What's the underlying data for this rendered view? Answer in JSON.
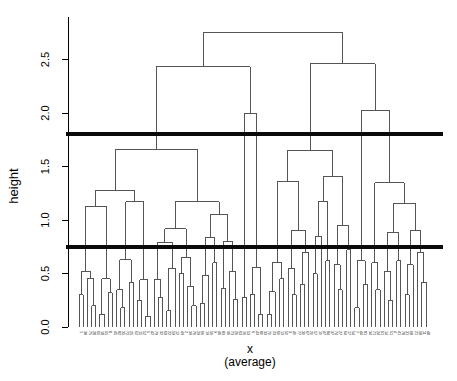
{
  "chart_data": {
    "type": "dendrogram",
    "title": "",
    "ylabel": "height",
    "xlabel": "x",
    "xlabel_sub": "(average)",
    "linkage": "average",
    "y_ticks": [
      0.0,
      0.5,
      1.0,
      1.5,
      2.0,
      2.5
    ],
    "y_tick_labels": [
      "0.0",
      "0.5",
      "1.0",
      "1.5",
      "2.0",
      "2.5"
    ],
    "y_axis_range_drawn": [
      0.0,
      2.9
    ],
    "grid": false,
    "legend": "none",
    "n_leaves": 84,
    "cut_lines": [
      {
        "height": 1.8,
        "color": "#0a0a0a",
        "lwd": 4
      },
      {
        "height": 0.75,
        "color": "#0a0a0a",
        "lwd": 4
      }
    ],
    "colors": {
      "background": "#ffffff",
      "link_line": "#555555",
      "axis": "#000000",
      "text": "#000000"
    },
    "leaf_labels": [
      1,
      38,
      75,
      28,
      65,
      18,
      55,
      8,
      45,
      82,
      35,
      72,
      25,
      62,
      15,
      52,
      5,
      42,
      79,
      32,
      69,
      22,
      59,
      12,
      49,
      2,
      39,
      76,
      29,
      66,
      19,
      56,
      9,
      46,
      83,
      36,
      73,
      26,
      63,
      16,
      53,
      6,
      43,
      80,
      33,
      70,
      23,
      60,
      13,
      50,
      3,
      40,
      77,
      30,
      67,
      20,
      57,
      10,
      47,
      84,
      37,
      74,
      27,
      64,
      17,
      54,
      7,
      44,
      81,
      34,
      71,
      24,
      61,
      14,
      51,
      4,
      41,
      78,
      31,
      68,
      21,
      58,
      11,
      48
    ],
    "tree": [
      2.75,
      [
        2.43,
        [
          1.66,
          [
            1.28,
            [
              1.13,
              [
                0.52,
                [
                  0.3,
                  null,
                  null
                ],
                [
                  0.45,
                  null,
                  [
                    0.2,
                    null,
                    null
                  ]
                ]
              ],
              [
                0.45,
                [
                  0.12,
                  null,
                  null
                ],
                [
                  0.32,
                  null,
                  null
                ]
              ]
            ],
            [
              1.17,
              [
                0.63,
                [
                  0.35,
                  null,
                  [
                    0.18,
                    null,
                    null
                  ]
                ],
                [
                  0.42,
                  null,
                  null
                ]
              ],
              [
                0.44,
                [
                  0.25,
                  null,
                  null
                ],
                [
                  0.1,
                  null,
                  null
                ]
              ]
            ]
          ],
          [
            1.17,
            [
              0.92,
              [
                0.79,
                [
                  0.44,
                  null,
                  [
                    0.28,
                    null,
                    null
                  ]
                ],
                [
                  0.55,
                  [
                    0.15,
                    null,
                    null
                  ],
                  null
                ]
              ],
              [
                0.65,
                [
                  0.5,
                  null,
                  null
                ],
                [
                  0.38,
                  null,
                  [
                    0.2,
                    null,
                    null
                  ]
                ]
              ]
            ],
            [
              1.05,
              [
                0.84,
                [
                  0.48,
                  [
                    0.22,
                    null,
                    null
                  ],
                  null
                ],
                [
                  0.6,
                  null,
                  null
                ]
              ],
              [
                0.8,
                [
                  0.36,
                  null,
                  null
                ],
                [
                  0.52,
                  null,
                  [
                    0.26,
                    null,
                    null
                  ]
                ]
              ]
            ]
          ]
        ],
        [
          2.0,
          [
            0.28,
            null,
            null
          ],
          [
            0.56,
            [
              0.3,
              null,
              null
            ],
            [
              0.12,
              null,
              null
            ]
          ]
        ]
      ],
      [
        2.46,
        [
          1.65,
          [
            1.36,
            [
              0.6,
              [
                0.33,
                [
                  0.12,
                  null,
                  null
                ],
                null
              ],
              [
                0.45,
                null,
                null
              ]
            ],
            [
              0.9,
              [
                0.55,
                null,
                [
                  0.3,
                  null,
                  null
                ]
              ],
              [
                0.7,
                [
                  0.4,
                  null,
                  null
                ],
                null
              ]
            ]
          ],
          [
            1.41,
            [
              1.17,
              [
                0.85,
                [
                  0.5,
                  null,
                  null
                ],
                null
              ],
              [
                0.62,
                null,
                null
              ]
            ],
            [
              0.95,
              [
                0.58,
                null,
                [
                  0.35,
                  null,
                  null
                ]
              ],
              [
                0.72,
                null,
                null
              ]
            ]
          ]
        ],
        [
          2.02,
          [
            0.62,
            [
              0.18,
              null,
              null
            ],
            [
              0.4,
              null,
              null
            ]
          ],
          [
            1.35,
            [
              0.6,
              null,
              [
                0.35,
                null,
                null
              ]
            ],
            [
              1.15,
              [
                0.88,
                [
                  0.52,
                  null,
                  [
                    0.25,
                    null,
                    null
                  ]
                ],
                [
                  0.62,
                  null,
                  null
                ]
              ],
              [
                0.9,
                [
                  0.58,
                  [
                    0.3,
                    null,
                    null
                  ],
                  null
                ],
                [
                  0.7,
                  null,
                  [
                    0.42,
                    null,
                    null
                  ]
                ]
              ]
            ]
          ]
        ]
      ]
    ]
  }
}
